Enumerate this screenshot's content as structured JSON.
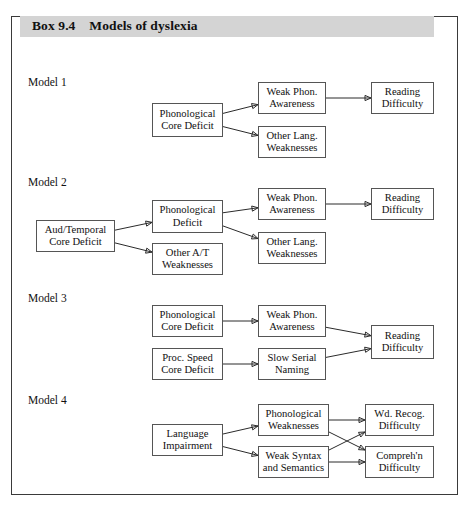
{
  "box": {
    "label": "Box 9.4",
    "title": "Models of dyslexia",
    "header_full": "Box 9.4    Models of dyslexia",
    "band_color": "#d4d4d4",
    "frame_color": "#3a3a3a"
  },
  "models": [
    {
      "label": "Model 1",
      "nodes": [
        {
          "id": "m1-phon-core",
          "text": "Phonological\nCore Deficit",
          "x": 152,
          "y": 103,
          "w": 71,
          "h": 34
        },
        {
          "id": "m1-weak-phon",
          "text": "Weak Phon.\nAwareness",
          "x": 258,
          "y": 82,
          "w": 68,
          "h": 32
        },
        {
          "id": "m1-other-lang",
          "text": "Other Lang.\nWeaknesses",
          "x": 258,
          "y": 126,
          "w": 68,
          "h": 32
        },
        {
          "id": "m1-reading-diff",
          "text": "Reading\nDifficulty",
          "x": 371,
          "y": 82,
          "w": 63,
          "h": 32
        }
      ],
      "edges": [
        {
          "from": "m1-phon-core",
          "to": "m1-weak-phon"
        },
        {
          "from": "m1-phon-core",
          "to": "m1-other-lang"
        },
        {
          "from": "m1-weak-phon",
          "to": "m1-reading-diff"
        }
      ]
    },
    {
      "label": "Model 2",
      "nodes": [
        {
          "id": "m2-aud-temp",
          "text": "Aud/Temporal\nCore Deficit",
          "x": 36,
          "y": 220,
          "w": 79,
          "h": 32
        },
        {
          "id": "m2-phon-def",
          "text": "Phonological\nDeficit",
          "x": 152,
          "y": 200,
          "w": 71,
          "h": 33
        },
        {
          "id": "m2-other-at",
          "text": "Other A/T\nWeaknesses",
          "x": 152,
          "y": 243,
          "w": 71,
          "h": 32
        },
        {
          "id": "m2-weak-phon",
          "text": "Weak Phon.\nAwareness",
          "x": 258,
          "y": 188,
          "w": 68,
          "h": 32
        },
        {
          "id": "m2-other-lang",
          "text": "Other Lang.\nWeaknesses",
          "x": 258,
          "y": 232,
          "w": 68,
          "h": 32
        },
        {
          "id": "m2-reading-diff",
          "text": "Reading\nDifficulty",
          "x": 371,
          "y": 188,
          "w": 63,
          "h": 32
        }
      ],
      "edges": [
        {
          "from": "m2-aud-temp",
          "to": "m2-phon-def"
        },
        {
          "from": "m2-aud-temp",
          "to": "m2-other-at"
        },
        {
          "from": "m2-phon-def",
          "to": "m2-weak-phon"
        },
        {
          "from": "m2-phon-def",
          "to": "m2-other-lang"
        },
        {
          "from": "m2-weak-phon",
          "to": "m2-reading-diff"
        }
      ]
    },
    {
      "label": "Model 3",
      "nodes": [
        {
          "id": "m3-phon-core",
          "text": "Phonological\nCore Deficit",
          "x": 152,
          "y": 305,
          "w": 71,
          "h": 32
        },
        {
          "id": "m3-proc-speed",
          "text": "Proc. Speed\nCore Deficit",
          "x": 152,
          "y": 348,
          "w": 71,
          "h": 32
        },
        {
          "id": "m3-weak-phon",
          "text": "Weak Phon.\nAwareness",
          "x": 258,
          "y": 305,
          "w": 68,
          "h": 32
        },
        {
          "id": "m3-slow-serial",
          "text": "Slow Serial\nNaming",
          "x": 258,
          "y": 348,
          "w": 68,
          "h": 32
        },
        {
          "id": "m3-reading-diff",
          "text": "Reading\nDifficulty",
          "x": 371,
          "y": 325,
          "w": 63,
          "h": 34
        }
      ],
      "edges": [
        {
          "from": "m3-phon-core",
          "to": "m3-weak-phon"
        },
        {
          "from": "m3-proc-speed",
          "to": "m3-slow-serial"
        },
        {
          "from": "m3-weak-phon",
          "to": "m3-reading-diff"
        },
        {
          "from": "m3-slow-serial",
          "to": "m3-reading-diff"
        }
      ]
    },
    {
      "label": "Model 4",
      "nodes": [
        {
          "id": "m4-lang-imp",
          "text": "Language\nImpairment",
          "x": 152,
          "y": 424,
          "w": 71,
          "h": 32
        },
        {
          "id": "m4-phon-weak",
          "text": "Phonological\nWeaknesses",
          "x": 258,
          "y": 404,
          "w": 71,
          "h": 32
        },
        {
          "id": "m4-weak-syntax",
          "text": "Weak Syntax\nand Semantics",
          "x": 258,
          "y": 446,
          "w": 71,
          "h": 32
        },
        {
          "id": "m4-wd-recog",
          "text": "Wd. Recog.\nDifficulty",
          "x": 365,
          "y": 404,
          "w": 69,
          "h": 32
        },
        {
          "id": "m4-compreh",
          "text": "Compreh'n\nDifficulty",
          "x": 365,
          "y": 446,
          "w": 69,
          "h": 32
        }
      ],
      "edges": [
        {
          "from": "m4-lang-imp",
          "to": "m4-phon-weak"
        },
        {
          "from": "m4-lang-imp",
          "to": "m4-weak-syntax"
        },
        {
          "from": "m4-phon-weak",
          "to": "m4-wd-recog"
        },
        {
          "from": "m4-phon-weak",
          "to": "m4-compreh"
        },
        {
          "from": "m4-weak-syntax",
          "to": "m4-wd-recog"
        },
        {
          "from": "m4-weak-syntax",
          "to": "m4-compreh"
        }
      ]
    }
  ],
  "model_label_positions": [
    {
      "x": 28,
      "y": 76
    },
    {
      "x": 28,
      "y": 176
    },
    {
      "x": 28,
      "y": 292
    },
    {
      "x": 28,
      "y": 394
    }
  ]
}
